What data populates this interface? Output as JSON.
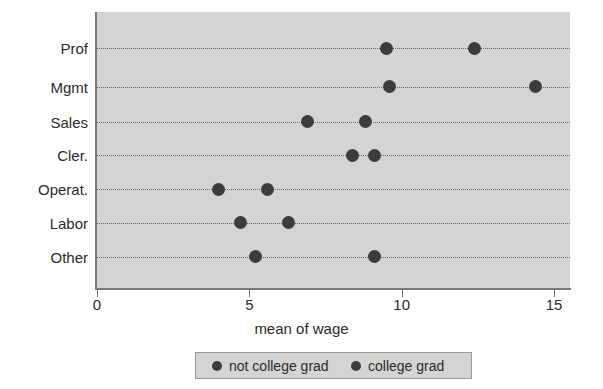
{
  "chart_data": {
    "type": "scatter",
    "title": "",
    "xlabel": "mean of wage",
    "ylabel": "",
    "xlim": [
      0,
      15
    ],
    "xticks": [
      0,
      5,
      10,
      15
    ],
    "xtick_labels": [
      "0",
      "5",
      "10",
      "15"
    ],
    "categories": [
      "Prof",
      "Mgmt",
      "Sales",
      "Cler.",
      "Operat.",
      "Labor",
      "Other"
    ],
    "grid": "horizontal dotted",
    "legend_position": "below axes, centered",
    "series": [
      {
        "name": "not college grad",
        "color": "#3c3c3c",
        "marker": "circle",
        "values": [
          9.5,
          9.6,
          6.9,
          8.4,
          4.0,
          4.7,
          5.2
        ]
      },
      {
        "name": "college grad",
        "color": "#3c3c3c",
        "marker": "circle",
        "values": [
          12.4,
          14.4,
          8.8,
          9.1,
          5.6,
          6.3,
          9.1
        ]
      }
    ]
  },
  "legend": {
    "entries": [
      {
        "label": "not college grad"
      },
      {
        "label": "college grad"
      }
    ]
  },
  "colors": {
    "panel_background": "#d4d4d4",
    "marker": "#3c3c3c",
    "gridline": "#6a6a6a",
    "axis": "#7a7a7a",
    "text": "#2b2b2b"
  }
}
